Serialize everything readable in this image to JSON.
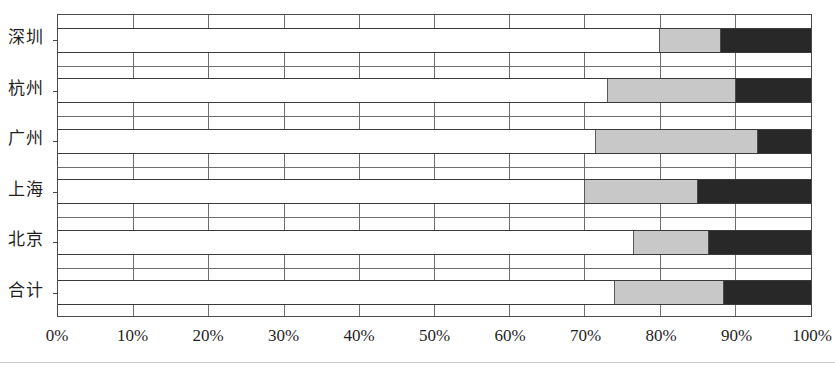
{
  "chart_data": {
    "type": "bar",
    "orientation": "horizontal",
    "stacked": true,
    "normalized": true,
    "title": "",
    "xlabel": "",
    "ylabel": "",
    "categories": [
      "深圳",
      "杭州",
      "广州",
      "上海",
      "北京",
      "合计"
    ],
    "xticks": [
      "0%",
      "10%",
      "20%",
      "30%",
      "40%",
      "50%",
      "60%",
      "70%",
      "80%",
      "90%",
      "100%"
    ],
    "xtick_values": [
      0,
      10,
      20,
      30,
      40,
      50,
      60,
      70,
      80,
      90,
      100
    ],
    "xlim": [
      0,
      100
    ],
    "grid": true,
    "legend": null,
    "series": [
      {
        "name": "series-white",
        "color": "#ffffff",
        "values": [
          80.0,
          73.0,
          71.5,
          70.0,
          76.5,
          74.0
        ]
      },
      {
        "name": "series-gray",
        "color": "#c8c8c8",
        "values": [
          8.0,
          17.0,
          21.5,
          15.0,
          10.0,
          14.5
        ]
      },
      {
        "name": "series-black",
        "color": "#282828",
        "values": [
          12.0,
          10.0,
          7.0,
          15.0,
          13.5,
          11.5
        ]
      }
    ],
    "rows": [
      {
        "category": "深圳",
        "segments": [
          {
            "name": "white",
            "start": 0,
            "end": 80.0,
            "value": 80.0
          },
          {
            "name": "gray",
            "start": 80.0,
            "end": 88.0,
            "value": 8.0
          },
          {
            "name": "black",
            "start": 88.0,
            "end": 100.0,
            "value": 12.0
          }
        ]
      },
      {
        "category": "杭州",
        "segments": [
          {
            "name": "white",
            "start": 0,
            "end": 73.0,
            "value": 73.0
          },
          {
            "name": "gray",
            "start": 73.0,
            "end": 90.0,
            "value": 17.0
          },
          {
            "name": "black",
            "start": 90.0,
            "end": 100.0,
            "value": 10.0
          }
        ]
      },
      {
        "category": "广州",
        "segments": [
          {
            "name": "white",
            "start": 0,
            "end": 71.5,
            "value": 71.5
          },
          {
            "name": "gray",
            "start": 71.5,
            "end": 93.0,
            "value": 21.5
          },
          {
            "name": "black",
            "start": 93.0,
            "end": 100.0,
            "value": 7.0
          }
        ]
      },
      {
        "category": "上海",
        "segments": [
          {
            "name": "white",
            "start": 0,
            "end": 70.0,
            "value": 70.0
          },
          {
            "name": "gray",
            "start": 70.0,
            "end": 85.0,
            "value": 15.0
          },
          {
            "name": "black",
            "start": 85.0,
            "end": 100.0,
            "value": 15.0
          }
        ]
      },
      {
        "category": "北京",
        "segments": [
          {
            "name": "white",
            "start": 0,
            "end": 76.5,
            "value": 76.5
          },
          {
            "name": "gray",
            "start": 76.5,
            "end": 86.5,
            "value": 10.0
          },
          {
            "name": "black",
            "start": 86.5,
            "end": 100.0,
            "value": 13.5
          }
        ]
      },
      {
        "category": "合计",
        "segments": [
          {
            "name": "white",
            "start": 0,
            "end": 74.0,
            "value": 74.0
          },
          {
            "name": "gray",
            "start": 74.0,
            "end": 88.5,
            "value": 14.5
          },
          {
            "name": "black",
            "start": 88.5,
            "end": 100.0,
            "value": 11.5
          }
        ]
      }
    ],
    "colors": {
      "white_segment": "#ffffff",
      "gray_segment": "#c8c8c8",
      "black_segment": "#282828",
      "axis": "#4a4a4a",
      "grid": "#6e6e6e"
    }
  }
}
